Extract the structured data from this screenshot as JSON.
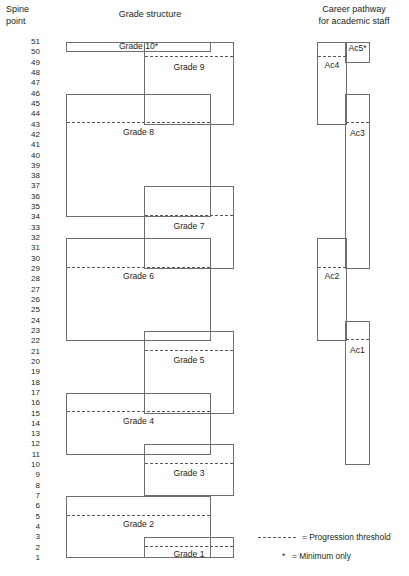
{
  "headers": {
    "spine": "Spine\npoint",
    "spine_line1": "Spine",
    "spine_line2": "point",
    "grade_structure": "Grade structure",
    "career_line1": "Career pathway",
    "career_line2": "for academic staff"
  },
  "spine_points": [
    51,
    50,
    49,
    48,
    47,
    46,
    45,
    44,
    43,
    42,
    41,
    40,
    39,
    38,
    37,
    36,
    35,
    34,
    33,
    32,
    31,
    30,
    29,
    28,
    27,
    26,
    25,
    24,
    23,
    22,
    21,
    20,
    19,
    18,
    17,
    16,
    15,
    14,
    13,
    12,
    11,
    10,
    9,
    8,
    7,
    6,
    5,
    4,
    3,
    2,
    1
  ],
  "scale": {
    "top_point": 51,
    "bottom_point": 1,
    "top_y": 42,
    "bottom_y": 558,
    "step_px": 10.32
  },
  "colors": {
    "box_stroke": "#6d6e70",
    "threshold_stroke": "#58595b",
    "text": "#231f20",
    "background": "#ffffff"
  },
  "grade_structure": {
    "column_left_x": 66,
    "column_left_w": 145,
    "column_right_x": 144,
    "column_right_w": 90,
    "boxes": [
      {
        "label": "Grade 10*",
        "column": "left",
        "top_point": 51,
        "bottom_point": 50,
        "threshold_point": null,
        "label_point": 50.6
      },
      {
        "label": "Grade 9",
        "column": "right",
        "top_point": 51,
        "bottom_point": 43,
        "threshold_point": 49.6,
        "label_point": 48.6
      },
      {
        "label": "Grade 8",
        "column": "left",
        "top_point": 46,
        "bottom_point": 34,
        "threshold_point": 43.2,
        "label_point": 42.3
      },
      {
        "label": "Grade 7",
        "column": "right",
        "top_point": 37,
        "bottom_point": 29,
        "threshold_point": 34.2,
        "label_point": 33.2
      },
      {
        "label": "Grade 6",
        "column": "left",
        "top_point": 32,
        "bottom_point": 22,
        "threshold_point": 29.2,
        "label_point": 28.3
      },
      {
        "label": "Grade 5",
        "column": "right",
        "top_point": 23,
        "bottom_point": 15,
        "threshold_point": 21.2,
        "label_point": 20.2
      },
      {
        "label": "Grade 4",
        "column": "left",
        "top_point": 17,
        "bottom_point": 11,
        "threshold_point": 15.2,
        "label_point": 14.3
      },
      {
        "label": "Grade 3",
        "column": "right",
        "top_point": 12,
        "bottom_point": 7,
        "threshold_point": 10.2,
        "label_point": 9.2
      },
      {
        "label": "Grade 2",
        "column": "left",
        "top_point": 7,
        "bottom_point": 1,
        "threshold_point": 5.2,
        "label_point": 4.3
      },
      {
        "label": "Grade 1",
        "column": "right",
        "top_point": 3,
        "bottom_point": 1,
        "threshold_point": 2.2,
        "label_point": 1.4
      }
    ]
  },
  "career_pathway": {
    "column_left_x": 317,
    "column_left_w": 30,
    "column_right_x": 345,
    "column_right_w": 25,
    "boxes": [
      {
        "label": "Ac5*",
        "column": "right",
        "top_point": 51,
        "bottom_point": 49,
        "threshold_point": null,
        "label_point": 50.4
      },
      {
        "label": "Ac4",
        "column": "left",
        "top_point": 51,
        "bottom_point": 43,
        "threshold_point": 49.6,
        "label_point": 48.8
      },
      {
        "label": "Ac3",
        "column": "right",
        "top_point": 46,
        "bottom_point": 29,
        "threshold_point": 43.2,
        "label_point": 42.2
      },
      {
        "label": "Ac2",
        "column": "left",
        "top_point": 32,
        "bottom_point": 22,
        "threshold_point": 29.2,
        "label_point": 28.3
      },
      {
        "label": "Ac1",
        "column": "right",
        "top_point": 24,
        "bottom_point": 10,
        "threshold_point": 22.2,
        "label_point": 21.2
      }
    ]
  },
  "legend": {
    "threshold_icon": "dashed-line-icon",
    "threshold_text": "= Progression threshold",
    "star_symbol": "*",
    "star_text": "= Minimum only"
  }
}
